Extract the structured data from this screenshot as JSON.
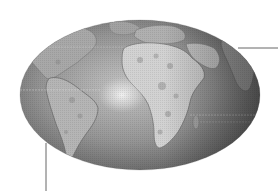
{
  "map": {
    "projection": "elliptical world map",
    "style": "grayscale relief",
    "regions_visible": [
      "north-america",
      "south-america",
      "africa",
      "europe",
      "middle-east",
      "atlantic-ocean",
      "indian-ocean"
    ],
    "colors": {
      "ocean_dark": "#5a5a5a",
      "ocean_mid": "#8a8a8a",
      "ocean_light": "#b8b8b8",
      "land": "#c9c9c9",
      "land_highlight": "#e4e4e4",
      "glare": "#f2f2f2",
      "leader_line": "#666666",
      "background": "#ffffff"
    }
  },
  "callouts": [
    {
      "id": "right-callout",
      "label": ""
    },
    {
      "id": "bottom-callout",
      "label": ""
    }
  ]
}
